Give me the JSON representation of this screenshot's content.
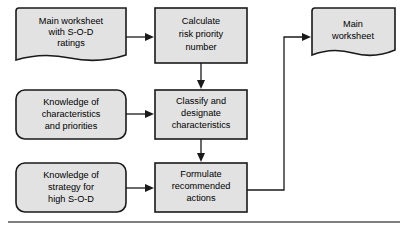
{
  "diagram": {
    "fill_color": "#e2e2e2",
    "stroke_color": "#1a1a1a",
    "nodes": [
      {
        "id": "main-worksheet-input",
        "shape": "document",
        "lines": [
          "Main worksheet",
          "with S-O-D",
          "ratings"
        ]
      },
      {
        "id": "calculate-rpn",
        "shape": "rectangle",
        "lines": [
          "Calculate",
          "risk priority",
          "number"
        ]
      },
      {
        "id": "main-worksheet-output",
        "shape": "document",
        "lines": [
          "Main",
          "worksheet"
        ]
      },
      {
        "id": "knowledge-characteristics",
        "shape": "rounded-rectangle",
        "lines": [
          "Knowledge of",
          "characteristics",
          "and priorities"
        ]
      },
      {
        "id": "classify-designate",
        "shape": "rectangle",
        "lines": [
          "Classify and",
          "designate",
          "characteristics"
        ]
      },
      {
        "id": "knowledge-strategy",
        "shape": "rounded-rectangle",
        "lines": [
          "Knowledge of",
          "strategy for",
          "high S-O-D"
        ]
      },
      {
        "id": "formulate-actions",
        "shape": "rectangle",
        "lines": [
          "Formulate",
          "recommended",
          "actions"
        ]
      }
    ]
  }
}
